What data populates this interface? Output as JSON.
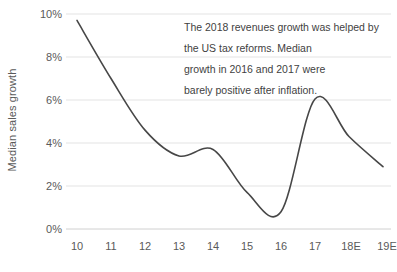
{
  "chart_data": {
    "type": "line",
    "title": "",
    "subtitle": "",
    "xlabel": "",
    "ylabel": "Median sales growth",
    "categories": [
      "10",
      "11",
      "12",
      "13",
      "14",
      "15",
      "16",
      "17",
      "18E",
      "19E"
    ],
    "x": [
      10,
      11,
      12,
      13,
      14,
      15,
      16,
      17,
      18,
      19
    ],
    "values": [
      9.7,
      7.0,
      4.6,
      3.4,
      3.7,
      1.7,
      0.8,
      6.05,
      4.3,
      2.9
    ],
    "series": [
      {
        "name": "Median sales growth",
        "values": [
          9.7,
          7.0,
          4.6,
          3.4,
          3.7,
          1.7,
          0.8,
          6.05,
          4.3,
          2.9
        ],
        "color": "#474747",
        "line_width": 1.6,
        "smooth": true,
        "markers": false
      }
    ],
    "ylim": [
      0,
      10
    ],
    "yticks": [
      0,
      2,
      4,
      6,
      8,
      10
    ],
    "ytick_labels": [
      "0%",
      "2%",
      "4%",
      "6%",
      "8%",
      "10%"
    ],
    "ytick_suffix": "%",
    "grid": {
      "horizontal": true,
      "vertical": false,
      "color": "#e3e3e3"
    },
    "legend": {
      "visible": false,
      "position": "none"
    },
    "annotations": [
      {
        "name": "commentary",
        "lines": [
          "The 2018 revenues growth was helped by",
          "the US tax reforms. Median",
          "growth in 2016 and 2017 were",
          "barely positive after inflation."
        ]
      }
    ],
    "axis_line_color": "#d0d0d0",
    "background_color": "#ffffff",
    "text_color": "#5a5a5a"
  }
}
